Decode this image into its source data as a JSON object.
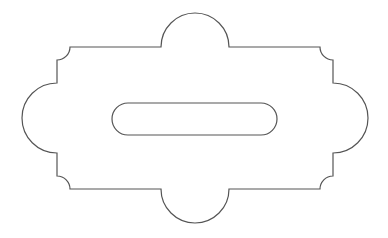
{
  "diagram": {
    "title": "",
    "stroke_color": "#555555",
    "fill_color": "#ffffff",
    "background": "#ffffff",
    "stroke_width": 1.2,
    "outline": {
      "top_edge_y": 47,
      "bottom_edge_y": 189,
      "left_edge_x": 57,
      "right_edge_x": 333,
      "top_lobe": {
        "cx": 195,
        "cy": 47,
        "r": 34
      },
      "bottom_lobe": {
        "cx": 195,
        "cy": 189,
        "r": 34
      },
      "left_lobe": {
        "cx": 57,
        "cy": 118,
        "r": 35
      },
      "right_lobe": {
        "cx": 333,
        "cy": 118,
        "r": 35
      },
      "corner_notch_radius": 13
    },
    "slot": {
      "x": 112,
      "y": 103,
      "width": 165,
      "height": 32,
      "rx": 16
    }
  }
}
